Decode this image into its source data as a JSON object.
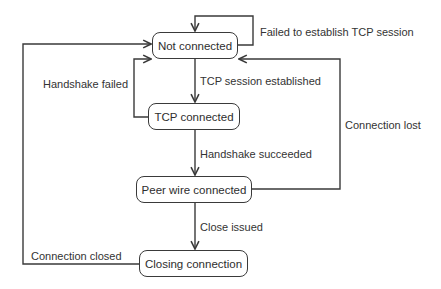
{
  "diagram": {
    "type": "state-machine",
    "states": [
      {
        "id": "not_connected",
        "label": "Not connected"
      },
      {
        "id": "tcp_connected",
        "label": "TCP connected"
      },
      {
        "id": "peer_wire_connected",
        "label": "Peer wire connected"
      },
      {
        "id": "closing_connection",
        "label": "Closing connection"
      }
    ],
    "transitions": [
      {
        "from": "not_connected",
        "to": "not_connected",
        "label": "Failed to establish TCP session"
      },
      {
        "from": "not_connected",
        "to": "tcp_connected",
        "label": "TCP session established"
      },
      {
        "from": "tcp_connected",
        "to": "not_connected",
        "label": "Handshake failed"
      },
      {
        "from": "tcp_connected",
        "to": "peer_wire_connected",
        "label": "Handshake succeeded"
      },
      {
        "from": "peer_wire_connected",
        "to": "not_connected",
        "label": "Connection lost"
      },
      {
        "from": "peer_wire_connected",
        "to": "closing_connection",
        "label": "Close issued"
      },
      {
        "from": "closing_connection",
        "to": "not_connected",
        "label": "Connection closed"
      }
    ]
  },
  "colors": {
    "line": "#3a3a3a",
    "text": "#333333",
    "background": "#ffffff"
  }
}
